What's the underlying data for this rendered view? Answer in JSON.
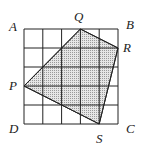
{
  "diagram": {
    "type": "geometry-grid",
    "grid": {
      "cols": 5,
      "rows": 5,
      "x0": 24,
      "y0": 29,
      "x1": 118,
      "y1": 124,
      "line_color": "#222222"
    },
    "square_corners": [
      {
        "name": "A",
        "label": "A",
        "lx": 9,
        "ly": 31
      },
      {
        "name": "B",
        "label": "B",
        "lx": 126,
        "ly": 29
      },
      {
        "name": "C",
        "label": "C",
        "lx": 126,
        "ly": 133
      },
      {
        "name": "D",
        "label": "D",
        "lx": 9,
        "ly": 133
      }
    ],
    "quadrilateral": {
      "fill": "#c8c8c8",
      "vertices": [
        {
          "name": "Q",
          "label": "Q",
          "x": 80.4,
          "y": 29,
          "lx": 74,
          "ly": 21
        },
        {
          "name": "R",
          "label": "R",
          "x": 118,
          "y": 48,
          "lx": 123,
          "ly": 52
        },
        {
          "name": "S",
          "label": "S",
          "x": 99.2,
          "y": 124,
          "lx": 96,
          "ly": 143
        },
        {
          "name": "P",
          "label": "P",
          "x": 24,
          "y": 86,
          "lx": 9,
          "ly": 90
        }
      ]
    }
  }
}
